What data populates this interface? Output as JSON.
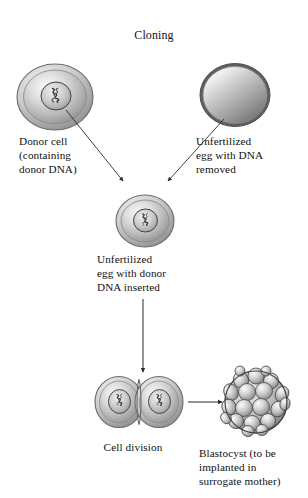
{
  "diagram": {
    "title": "Cloning",
    "background_color": "#ffffff",
    "text_color": "#111111",
    "type": "biology-process-flow",
    "stroke_color": "#4a4a4a"
  },
  "labels": {
    "title": "Cloning",
    "donor_cell": "Donor cell\n(containing\ndonor DNA)",
    "unfertilized_egg": "Unfertilized\negg with DNA\nremoved",
    "egg_with_donor_dna": "Unfertilized\negg with donor\nDNA inserted",
    "cell_division": "Cell division",
    "blastocyst": "Blastocyst (to be\nimplanted in\nsurrogate mother)"
  },
  "nodes": [
    {
      "id": "donor-cell",
      "label": "Donor cell",
      "shape": "cell-with-nucleus",
      "cx": 55,
      "cy": 97,
      "rx": 38,
      "ry": 33,
      "has_nucleus": true,
      "has_dna": true
    },
    {
      "id": "unfertilized-egg",
      "label": "Unfertilized egg with DNA removed",
      "shape": "cell-plain",
      "cx": 235,
      "cy": 95,
      "rx": 35,
      "ry": 31,
      "has_nucleus": false,
      "has_dna": false
    },
    {
      "id": "egg-with-donor-dna",
      "label": "Unfertilized egg with donor DNA inserted",
      "shape": "cell-with-nucleus",
      "cx": 145,
      "cy": 221,
      "rx": 29,
      "ry": 26,
      "has_nucleus": true,
      "has_dna": true
    },
    {
      "id": "dividing-cell-left",
      "label": "Cell division left daughter cell",
      "shape": "cell-with-nucleus",
      "cx": 119,
      "cy": 402,
      "rx": 24,
      "ry": 25,
      "has_nucleus": true,
      "has_dna": true
    },
    {
      "id": "dividing-cell-right",
      "label": "Cell division right daughter cell",
      "shape": "cell-with-nucleus",
      "cx": 159,
      "cy": 402,
      "rx": 24,
      "ry": 25,
      "has_nucleus": true,
      "has_dna": true
    },
    {
      "id": "blastocyst",
      "label": "Blastocyst",
      "shape": "multicellular-sphere",
      "cx": 256,
      "cy": 402,
      "rx": 31,
      "ry": 31,
      "has_nucleus": false,
      "has_dna": false
    }
  ],
  "connectors": [
    {
      "id": "donor-to-center",
      "from": "donor-cell",
      "to": "egg-with-donor-dna",
      "style": "arrow",
      "direction": "down-right"
    },
    {
      "id": "egg-to-center",
      "from": "unfertilized-egg",
      "to": "egg-with-donor-dna",
      "style": "arrow",
      "direction": "down-left"
    },
    {
      "id": "center-to-division",
      "from": "egg-with-donor-dna",
      "to": "dividing-cells",
      "style": "arrow",
      "direction": "down"
    },
    {
      "id": "division-to-blastocyst",
      "from": "dividing-cells",
      "to": "blastocyst",
      "style": "arrow",
      "direction": "right"
    }
  ]
}
